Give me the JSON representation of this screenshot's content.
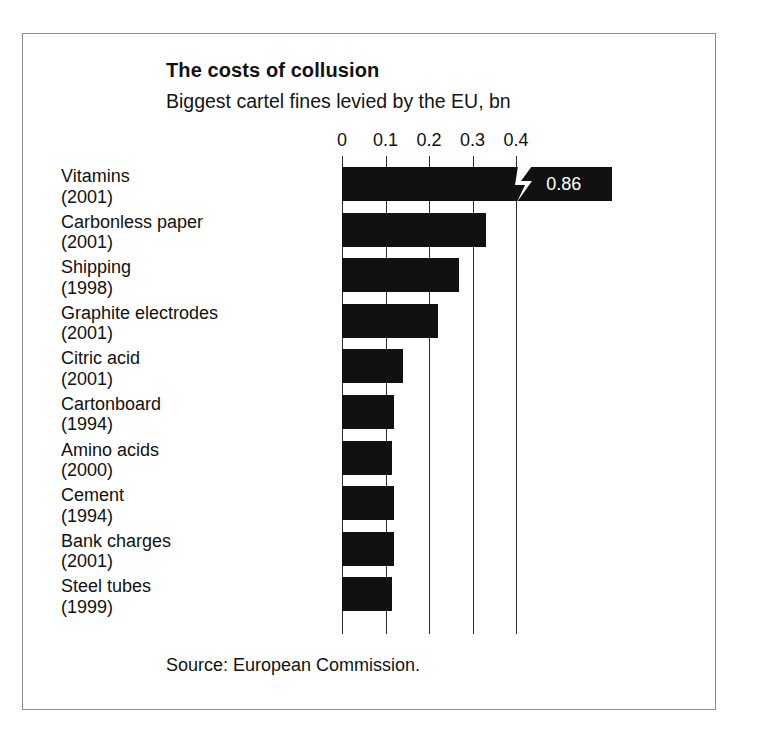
{
  "figure": {
    "title": "The costs of collusion",
    "subtitle": "Biggest cartel fines levied by the EU, bn",
    "source": "Source: European Commission.",
    "frame_color": "#8d8d90",
    "bar_color": "#111111",
    "background": "#ffffff"
  },
  "chart_data": {
    "type": "bar",
    "orientation": "horizontal",
    "title": "The costs of collusion",
    "subtitle": "Biggest cartel fines levied by the EU, bn",
    "xlabel": "",
    "ylabel": "",
    "xlim": [
      0,
      0.45
    ],
    "xticks": [
      0,
      0.1,
      0.2,
      0.3,
      0.4
    ],
    "xticklabels": [
      "0",
      "0.1",
      "0.2",
      "0.3",
      "0.4"
    ],
    "grid": true,
    "legend": null,
    "source": "Source: European Commission.",
    "note": "Top bar is axis-broken; its true value 0.86 is printed inside the bar.",
    "categories": [
      "Vitamins (2001)",
      "Carbonless paper (2001)",
      "Shipping (1998)",
      "Graphite electrodes (2001)",
      "Citric acid (2001)",
      "Cartonboard (1994)",
      "Amino acids (2000)",
      "Cement (1994)",
      "Bank charges (2001)",
      "Steel tubes (1999)"
    ],
    "values": [
      0.86,
      0.33,
      0.27,
      0.22,
      0.14,
      0.12,
      0.115,
      0.12,
      0.12,
      0.115
    ],
    "bars": [
      {
        "name": "Vitamins",
        "year": "(2001)",
        "value": 0.86,
        "drawn_value": 0.41,
        "broken": true,
        "value_label": "0.86"
      },
      {
        "name": "Carbonless paper",
        "year": "(2001)",
        "value": 0.33,
        "drawn_value": 0.33,
        "broken": false,
        "value_label": ""
      },
      {
        "name": "Shipping",
        "year": "(1998)",
        "value": 0.27,
        "drawn_value": 0.27,
        "broken": false,
        "value_label": ""
      },
      {
        "name": "Graphite electrodes",
        "year": "(2001)",
        "value": 0.22,
        "drawn_value": 0.22,
        "broken": false,
        "value_label": ""
      },
      {
        "name": "Citric acid",
        "year": "(2001)",
        "value": 0.14,
        "drawn_value": 0.14,
        "broken": false,
        "value_label": ""
      },
      {
        "name": "Cartonboard",
        "year": "(1994)",
        "value": 0.12,
        "drawn_value": 0.12,
        "broken": false,
        "value_label": ""
      },
      {
        "name": "Amino acids",
        "year": "(2000)",
        "value": 0.115,
        "drawn_value": 0.115,
        "broken": false,
        "value_label": ""
      },
      {
        "name": "Cement",
        "year": "(1994)",
        "value": 0.12,
        "drawn_value": 0.12,
        "broken": false,
        "value_label": ""
      },
      {
        "name": "Bank charges",
        "year": "(2001)",
        "value": 0.12,
        "drawn_value": 0.12,
        "broken": false,
        "value_label": ""
      },
      {
        "name": "Steel tubes",
        "year": "(1999)",
        "value": 0.115,
        "drawn_value": 0.115,
        "broken": false,
        "value_label": ""
      }
    ]
  }
}
